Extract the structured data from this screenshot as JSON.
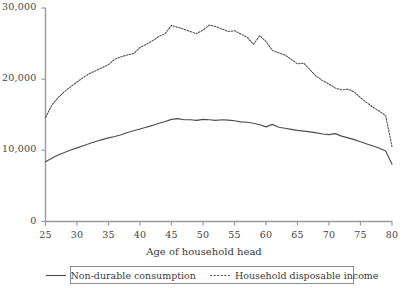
{
  "chart_data": {
    "type": "line",
    "title": "",
    "xlabel": "Age of household head",
    "ylabel": "",
    "xlim": [
      25,
      80
    ],
    "ylim": [
      0,
      30000
    ],
    "grid": false,
    "legend_position": "bottom",
    "xticks": [
      25,
      30,
      35,
      40,
      45,
      50,
      55,
      60,
      65,
      70,
      75,
      80
    ],
    "xtick_labels": [
      "25",
      "30",
      "35",
      "40",
      "45",
      "50",
      "55",
      "60",
      "65",
      "70",
      "75",
      "80"
    ],
    "yticks": [
      0,
      10000,
      20000,
      30000
    ],
    "ytick_labels": [
      "0",
      "10,000",
      "20,000",
      "30,000"
    ],
    "x": [
      25,
      26,
      27,
      28,
      29,
      30,
      31,
      32,
      33,
      34,
      35,
      36,
      37,
      38,
      39,
      40,
      41,
      42,
      43,
      44,
      45,
      46,
      47,
      48,
      49,
      50,
      51,
      52,
      53,
      54,
      55,
      56,
      57,
      58,
      59,
      60,
      61,
      62,
      63,
      64,
      65,
      66,
      67,
      68,
      69,
      70,
      71,
      72,
      73,
      74,
      75,
      76,
      77,
      78,
      79,
      80
    ],
    "series": [
      {
        "name": "Non-durable consumption",
        "style": "solid",
        "color": "#4d4d4d",
        "values": [
          8400,
          8900,
          9350,
          9700,
          10050,
          10350,
          10650,
          10950,
          11250,
          11500,
          11750,
          11950,
          12200,
          12500,
          12750,
          13000,
          13250,
          13500,
          13800,
          14050,
          14350,
          14450,
          14300,
          14300,
          14200,
          14350,
          14300,
          14200,
          14300,
          14250,
          14150,
          14000,
          13950,
          13800,
          13600,
          13300,
          13650,
          13250,
          13100,
          12950,
          12800,
          12700,
          12600,
          12450,
          12300,
          12200,
          12350,
          12000,
          11750,
          11500,
          11200,
          10900,
          10600,
          10300,
          9900,
          8050
        ]
      },
      {
        "name": "Household disposable income",
        "style": "dotted",
        "color": "#4d4d4d",
        "values": [
          14600,
          16350,
          17400,
          18250,
          18950,
          19600,
          20250,
          20800,
          21200,
          21600,
          22050,
          22800,
          23150,
          23400,
          23600,
          24450,
          24900,
          25400,
          26000,
          26400,
          27550,
          27300,
          27000,
          26700,
          26400,
          26900,
          27600,
          27400,
          27050,
          26700,
          26800,
          26350,
          25900,
          24900,
          26100,
          25300,
          24050,
          23700,
          23400,
          22800,
          22150,
          22250,
          21300,
          20400,
          19800,
          19300,
          18750,
          18500,
          18600,
          18200,
          17400,
          16700,
          16050,
          15500,
          14850,
          10500
        ]
      }
    ]
  },
  "axes": {
    "y_axis_name": "value-axis",
    "x_axis_name": "age-axis"
  }
}
